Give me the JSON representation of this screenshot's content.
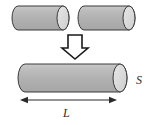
{
  "figure": {
    "colors": {
      "cylinder_fill": "#b3b3b3",
      "cylinder_cap_fill": "#d9d9d9",
      "outline": "#333333",
      "arrow_outline": "#1a1a1a",
      "arrow_fill": "#ffffff",
      "dimension_line": "#2b2b2b",
      "background": "#ffffff",
      "label_color": "#2b2b2b"
    },
    "top_row": {
      "name": "two-source-cylinders",
      "count": 2,
      "cylinders": [
        {
          "name": "left-cylinder",
          "x": 12,
          "y": 6,
          "width": 58,
          "height": 24
        },
        {
          "name": "right-cylinder",
          "x": 78,
          "y": 6,
          "width": 58,
          "height": 24
        }
      ]
    },
    "merge_arrow": {
      "name": "down-arrow",
      "direction": "down",
      "style": "hollow-outline",
      "x": 62,
      "y": 35,
      "width": 26,
      "height": 24
    },
    "bottom_row": {
      "name": "merged-cylinder",
      "x": 18,
      "y": 64,
      "width": 110,
      "height": 28
    },
    "labels": {
      "area_label": "S",
      "length_label": "L"
    },
    "dimension": {
      "name": "length-dimension",
      "label": "L",
      "arrow_style": "double-headed",
      "x_start": 20,
      "x_end": 117,
      "y": 100
    }
  }
}
